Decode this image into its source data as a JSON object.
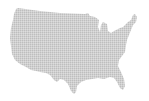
{
  "map": {
    "subject": "United States (contiguous) dotted map",
    "style": "halftone dot grid",
    "colors": {
      "background": "#ffffff",
      "dot": "#8c8c8c"
    },
    "dot_pitch_px": 2,
    "dot_radius_px": 0.75
  }
}
